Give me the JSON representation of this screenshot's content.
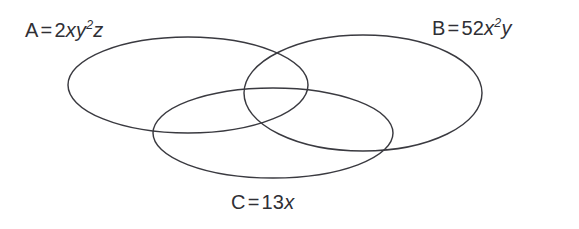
{
  "figure": {
    "type": "venn-diagram",
    "set_count": 3,
    "background_color": "#ffffff",
    "stroke_color": "#3a3a40",
    "text_color": "#2f2f35"
  },
  "sets": [
    {
      "id": "A",
      "name": "set-a",
      "label_text": "A = 2xy²z",
      "set_letter": "A",
      "equals": "=",
      "coefficient": "2",
      "var1": "x",
      "var2": "y",
      "exponent2": "2",
      "var3": "z",
      "geometry": {
        "cx": 188,
        "cy": 85,
        "rx": 120,
        "ry": 48
      }
    },
    {
      "id": "B",
      "name": "set-b",
      "label_text": "B = 52x²y",
      "set_letter": "B",
      "equals": "=",
      "coefficient": "52",
      "var1": "x",
      "exponent1": "2",
      "var2": "y",
      "geometry": {
        "cx": 363,
        "cy": 93,
        "rx": 119,
        "ry": 58
      }
    },
    {
      "id": "C",
      "name": "set-c",
      "label_text": "C = 13x",
      "set_letter": "C",
      "equals": "=",
      "coefficient": "13",
      "var1": "x",
      "geometry": {
        "cx": 273,
        "cy": 133,
        "rx": 120,
        "ry": 45
      }
    }
  ]
}
